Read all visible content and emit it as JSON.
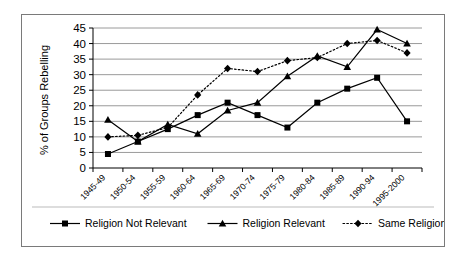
{
  "chart_data": {
    "type": "line",
    "title": "",
    "xlabel": "",
    "ylabel": "% of Groups Rebelling",
    "ylim": [
      0,
      45
    ],
    "ytick_step": 5,
    "yticks": [
      "0",
      "5",
      "10",
      "15",
      "20",
      "25",
      "30",
      "35",
      "40",
      "45"
    ],
    "grid": true,
    "legend_position": "bottom",
    "categories": [
      "1945-49",
      "1950-54",
      "1955-59",
      "1960-64",
      "1965-69",
      "1970-74",
      "1975-79",
      "1980-84",
      "1985-89",
      "1990-94",
      "1995-2000"
    ],
    "series": [
      {
        "name": "Religion Not Relevant",
        "marker": "square",
        "linestyle": "solid",
        "color": "#000000",
        "values": [
          4.5,
          8.5,
          12.5,
          17,
          21,
          17,
          13,
          21,
          25.5,
          29,
          15
        ]
      },
      {
        "name": "Religion Relevant",
        "marker": "triangle",
        "linestyle": "solid",
        "color": "#000000",
        "values": [
          15.5,
          8.5,
          14,
          11,
          18.5,
          21,
          29.5,
          36,
          32.5,
          44.5,
          40
        ]
      },
      {
        "name": "Same Religion",
        "marker": "diamond",
        "linestyle": "dotted",
        "color": "#000000",
        "values": [
          10,
          10.5,
          13,
          23.5,
          32,
          31,
          34.5,
          35.5,
          40,
          41,
          37
        ]
      }
    ]
  },
  "legend": {
    "items": [
      {
        "label": "Religion Not Relevant",
        "marker": "square",
        "linestyle": "solid"
      },
      {
        "label": "Religion Relevant",
        "marker": "triangle",
        "linestyle": "solid"
      },
      {
        "label": "Same Religion",
        "marker": "diamond",
        "linestyle": "dotted"
      }
    ]
  }
}
